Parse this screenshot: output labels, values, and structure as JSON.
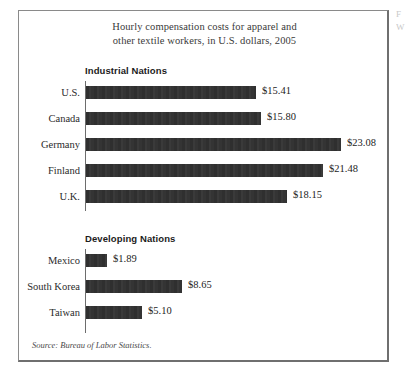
{
  "title": {
    "line1": "Hourly compensation costs for apparel and",
    "line2": "other textile workers, in U.S. dollars, 2005"
  },
  "sections": [
    {
      "heading": "Industrial Nations",
      "rows": [
        {
          "label": "U.S.",
          "value_label": "$15.41",
          "value": 15.41
        },
        {
          "label": "Canada",
          "value_label": "$15.80",
          "value": 15.8
        },
        {
          "label": "Germany",
          "value_label": "$23.08",
          "value": 23.08
        },
        {
          "label": "Finland",
          "value_label": "$21.48",
          "value": 21.48
        },
        {
          "label": "U.K.",
          "value_label": "$18.15",
          "value": 18.15
        }
      ]
    },
    {
      "heading": "Developing Nations",
      "rows": [
        {
          "label": "Mexico",
          "value_label": "$1.89",
          "value": 1.89
        },
        {
          "label": "South Korea",
          "value_label": "$8.65",
          "value": 8.65
        },
        {
          "label": "Taiwan",
          "value_label": "$5.10",
          "value": 5.1
        }
      ]
    }
  ],
  "source": "Source: Bureau of Labor Statistics.",
  "margin_text": "F\nW",
  "colors": {
    "bar": "#333333",
    "frame": "#8a8a8a",
    "axis": "#6d6d6d",
    "title_text": "#3a3a3a",
    "body_text": "#2b2b2b"
  },
  "scale": {
    "pixels_per_dollar": 11.05,
    "bar_origin_x": 67
  },
  "chart_data": {
    "type": "bar",
    "orientation": "horizontal",
    "title": "Hourly compensation costs for apparel and other textile workers, in U.S. dollars, 2005",
    "xlabel": "",
    "ylabel": "",
    "grid": false,
    "legend": "none",
    "xlim": [
      0,
      23.08
    ],
    "groups": [
      {
        "name": "Industrial Nations",
        "categories": [
          "U.S.",
          "Canada",
          "Germany",
          "Finland",
          "U.K."
        ],
        "values": [
          15.41,
          15.8,
          23.08,
          21.48,
          18.15
        ],
        "value_labels": [
          "$15.41",
          "$15.80",
          "$23.08",
          "$21.48",
          "$18.15"
        ]
      },
      {
        "name": "Developing Nations",
        "categories": [
          "Mexico",
          "South Korea",
          "Taiwan"
        ],
        "values": [
          1.89,
          8.65,
          5.1
        ],
        "value_labels": [
          "$1.89",
          "$8.65",
          "$5.10"
        ]
      }
    ],
    "categories": [
      "U.S.",
      "Canada",
      "Germany",
      "Finland",
      "U.K.",
      "Mexico",
      "South Korea",
      "Taiwan"
    ],
    "values": [
      15.41,
      15.8,
      23.08,
      21.48,
      18.15,
      1.89,
      8.65,
      5.1
    ],
    "units": "U.S. dollars per hour",
    "source": "Source: Bureau of Labor Statistics."
  }
}
